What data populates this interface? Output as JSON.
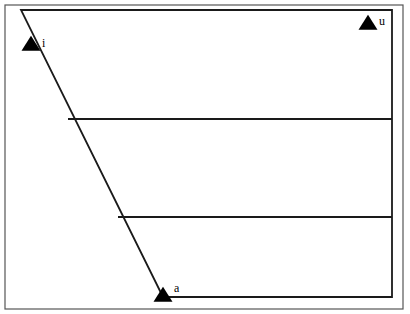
{
  "figure": {
    "name": "vowel-quadrilateral",
    "background_color": "#ffffff",
    "line_color": "#1a1a1a",
    "marker_color": "#000000",
    "frame_color": "#555555"
  },
  "chart_data": {
    "type": "scatter",
    "title": "",
    "xlabel": "",
    "ylabel": "",
    "grid": false,
    "legend": "none",
    "xlim": [
      0,
      410
    ],
    "ylim": [
      314,
      0
    ],
    "quadrilateral": {
      "name": "vowel-trapezoid",
      "vertices": [
        {
          "label": "top-left",
          "x": 21,
          "y": 10
        },
        {
          "label": "top-right",
          "x": 392,
          "y": 10
        },
        {
          "label": "bottom-right",
          "x": 392,
          "y": 297
        },
        {
          "label": "bottom-left",
          "x": 163,
          "y": 297
        }
      ]
    },
    "divider_lines": [
      {
        "name": "mid-high-divider",
        "x1": 68,
        "y1": 119,
        "x2": 392,
        "y2": 119
      },
      {
        "name": "mid-low-divider",
        "x1": 118,
        "y1": 217,
        "x2": 392,
        "y2": 217
      }
    ],
    "points": [
      {
        "label": "i",
        "x": 31,
        "y": 45,
        "label_x": 42,
        "label_y": 47,
        "marker": "triangle-up"
      },
      {
        "label": "u",
        "x": 368,
        "y": 24,
        "label_x": 379,
        "label_y": 25,
        "marker": "triangle-up"
      },
      {
        "label": "a",
        "x": 163,
        "y": 296,
        "label_x": 174,
        "label_y": 292,
        "marker": "triangle-up"
      }
    ],
    "outer_frame": {
      "x": 5,
      "y": 5,
      "width": 398,
      "height": 304
    }
  }
}
